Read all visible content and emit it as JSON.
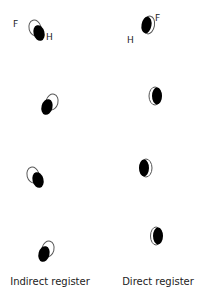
{
  "diagram": {
    "columns": [
      {
        "label": "Indirect register",
        "label_x": 50,
        "pairs": [
          {
            "outline": {
              "cx": 35,
              "cy": 28,
              "rx": 6,
              "ry": 8,
              "rot": -15
            },
            "filled": {
              "cx": 39,
              "cy": 33,
              "rx": 5.5,
              "ry": 8,
              "rot": -15
            }
          },
          {
            "outline": {
              "cx": 52,
              "cy": 102,
              "rx": 6,
              "ry": 8,
              "rot": 15
            },
            "filled": {
              "cx": 47,
              "cy": 107,
              "rx": 5.5,
              "ry": 8,
              "rot": 15
            }
          },
          {
            "outline": {
              "cx": 33,
              "cy": 175,
              "rx": 6,
              "ry": 8,
              "rot": -15
            },
            "filled": {
              "cx": 38,
              "cy": 180,
              "rx": 5.5,
              "ry": 8,
              "rot": -15
            }
          },
          {
            "outline": {
              "cx": 48,
              "cy": 249,
              "rx": 6,
              "ry": 8,
              "rot": 15
            },
            "filled": {
              "cx": 44,
              "cy": 254,
              "rx": 5.5,
              "ry": 8,
              "rot": 15
            }
          }
        ],
        "markers": [
          {
            "text": "F",
            "x": 13,
            "y": 27
          },
          {
            "text": "H",
            "x": 46,
            "y": 40
          }
        ]
      },
      {
        "label": "Direct register",
        "label_x": 158,
        "pairs": [
          {
            "outline": {
              "cx": 149,
              "cy": 25,
              "rx": 5.5,
              "ry": 9,
              "rot": 10
            },
            "filled": {
              "cx": 146.5,
              "cy": 25,
              "rx": 5,
              "ry": 8.5,
              "rot": 10
            }
          },
          {
            "outline": {
              "cx": 155,
              "cy": 96,
              "rx": 6,
              "ry": 9,
              "rot": 0
            },
            "filled": {
              "cx": 157,
              "cy": 96,
              "rx": 5,
              "ry": 8.5,
              "rot": 0
            }
          },
          {
            "outline": {
              "cx": 146,
              "cy": 168,
              "rx": 6,
              "ry": 9,
              "rot": 0
            },
            "filled": {
              "cx": 144,
              "cy": 168,
              "rx": 5,
              "ry": 8.5,
              "rot": 0
            }
          },
          {
            "outline": {
              "cx": 156,
              "cy": 236,
              "rx": 5.5,
              "ry": 9,
              "rot": 0
            },
            "filled": {
              "cx": 158,
              "cy": 236,
              "rx": 5,
              "ry": 8.5,
              "rot": 0
            }
          }
        ],
        "markers": [
          {
            "text": "F",
            "x": 155,
            "y": 21
          },
          {
            "text": "H",
            "x": 127,
            "y": 43
          }
        ]
      }
    ],
    "colors": {
      "fill": "#000000",
      "outline": "#555555",
      "text": "#222222",
      "background": "#ffffff"
    }
  }
}
